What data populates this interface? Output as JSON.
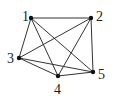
{
  "graph": {
    "type": "complete-graph",
    "name": "K5",
    "nodes": [
      {
        "id": "1",
        "label": "1",
        "x": 31,
        "y": 18,
        "lx": 22,
        "ly": 21
      },
      {
        "id": "2",
        "label": "2",
        "x": 91,
        "y": 18,
        "lx": 96,
        "ly": 21
      },
      {
        "id": "3",
        "label": "3",
        "x": 19,
        "y": 58,
        "lx": 7,
        "ly": 63
      },
      {
        "id": "4",
        "label": "4",
        "x": 58,
        "y": 76,
        "lx": 54,
        "ly": 94
      },
      {
        "id": "5",
        "label": "5",
        "x": 93,
        "y": 72,
        "lx": 98,
        "ly": 79
      }
    ],
    "edges": [
      [
        "1",
        "2"
      ],
      [
        "1",
        "3"
      ],
      [
        "1",
        "4"
      ],
      [
        "1",
        "5"
      ],
      [
        "2",
        "3"
      ],
      [
        "2",
        "4"
      ],
      [
        "2",
        "5"
      ],
      [
        "3",
        "4"
      ],
      [
        "3",
        "5"
      ],
      [
        "4",
        "5"
      ]
    ]
  }
}
